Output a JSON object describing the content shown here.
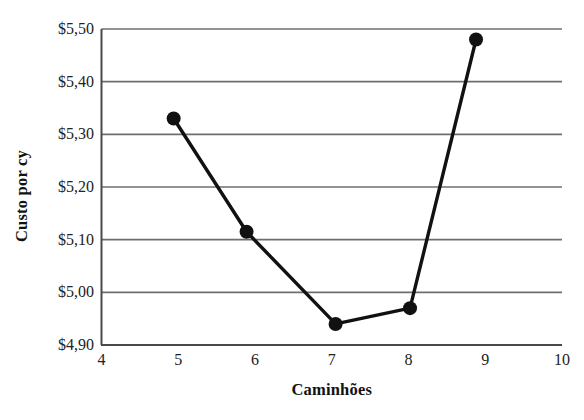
{
  "chart_data": {
    "type": "line",
    "title": "",
    "xlabel": "Caminhões",
    "ylabel": "Custo por cy",
    "x": [
      4.94,
      5.89,
      7.05,
      8.02,
      8.88
    ],
    "values": [
      5.33,
      5.115,
      4.94,
      4.97,
      5.48
    ],
    "series": [
      {
        "name": "Custo por cy",
        "points": [
          {
            "x": 4.94,
            "y": 5.33
          },
          {
            "x": 5.89,
            "y": 5.115
          },
          {
            "x": 7.05,
            "y": 4.94
          },
          {
            "x": 8.02,
            "y": 4.97
          },
          {
            "x": 8.88,
            "y": 5.48
          }
        ]
      }
    ],
    "xlim": [
      4,
      10
    ],
    "ylim": [
      4.9,
      5.5
    ],
    "xticks": [
      "4",
      "5",
      "6",
      "7",
      "8",
      "9",
      "10"
    ],
    "xtick_values": [
      4,
      5,
      6,
      7,
      8,
      9,
      10
    ],
    "yticks": [
      "$4,90",
      "$5,00",
      "$5,10",
      "$5,20",
      "$5,30",
      "$5,40",
      "$5,50"
    ],
    "ytick_values": [
      4.9,
      5.0,
      5.1,
      5.2,
      5.3,
      5.4,
      5.5
    ],
    "grid": "horizontal",
    "legend": "none",
    "marker": "filled-circle",
    "line_color": "#111111",
    "grid_color": "#6e6e6e",
    "axis_color": "#555555",
    "background": "#ffffff"
  }
}
